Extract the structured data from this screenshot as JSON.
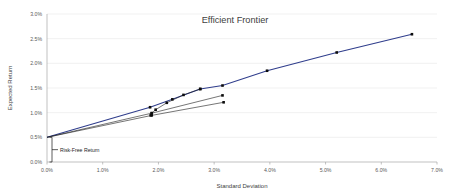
{
  "chart_data": {
    "type": "line",
    "title": "Efficient Frontier",
    "xlabel": "Standard Deviation",
    "ylabel": "Expected Return",
    "xlim": [
      0.0,
      7.0
    ],
    "ylim": [
      0.0,
      3.0
    ],
    "grid": true,
    "legend": "none",
    "x_ticks": [
      "0.0%",
      "1.0%",
      "2.0%",
      "3.0%",
      "4.0%",
      "5.0%",
      "6.0%",
      "7.0%"
    ],
    "x_tick_values": [
      0.0,
      1.0,
      2.0,
      3.0,
      4.0,
      5.0,
      6.0,
      7.0
    ],
    "y_ticks": [
      "0.0%",
      "0.5%",
      "1.0%",
      "1.5%",
      "2.0%",
      "2.5%",
      "3.0%"
    ],
    "y_tick_values": [
      0.0,
      0.5,
      1.0,
      1.5,
      2.0,
      2.5,
      3.0
    ],
    "risk_free_rate": 0.5,
    "series": [
      {
        "name": "Capital Allocation Line / Efficient Frontier",
        "color": "#2f3d8c",
        "markers": true,
        "x": [
          0.0,
          1.85,
          2.25,
          2.75,
          3.15,
          3.95,
          5.2,
          6.55
        ],
        "y": [
          0.5,
          1.11,
          1.27,
          1.48,
          1.55,
          1.85,
          2.22,
          2.59
        ]
      },
      {
        "name": "Portfolio Line 2",
        "color": "#1a1a1a",
        "markers": true,
        "x": [
          0.0,
          1.88,
          3.15
        ],
        "y": [
          0.5,
          0.99,
          1.35
        ]
      },
      {
        "name": "Portfolio Line 3",
        "color": "#1a1a1a",
        "markers": true,
        "x": [
          0.0,
          1.88,
          3.17
        ],
        "y": [
          0.5,
          0.945,
          1.21
        ]
      },
      {
        "name": "Frontier Lower Arc",
        "color": "#1a1a1a",
        "markers": true,
        "x": [
          1.86,
          1.88,
          1.95,
          2.15,
          2.45,
          2.75
        ],
        "y": [
          0.945,
          0.99,
          1.06,
          1.2,
          1.36,
          1.48
        ]
      }
    ],
    "annotations": [
      {
        "name": "risk-free-return",
        "label": "Risk-Free Return",
        "x": 0.0,
        "y_from": 0.0,
        "y_to": 0.5
      }
    ]
  }
}
